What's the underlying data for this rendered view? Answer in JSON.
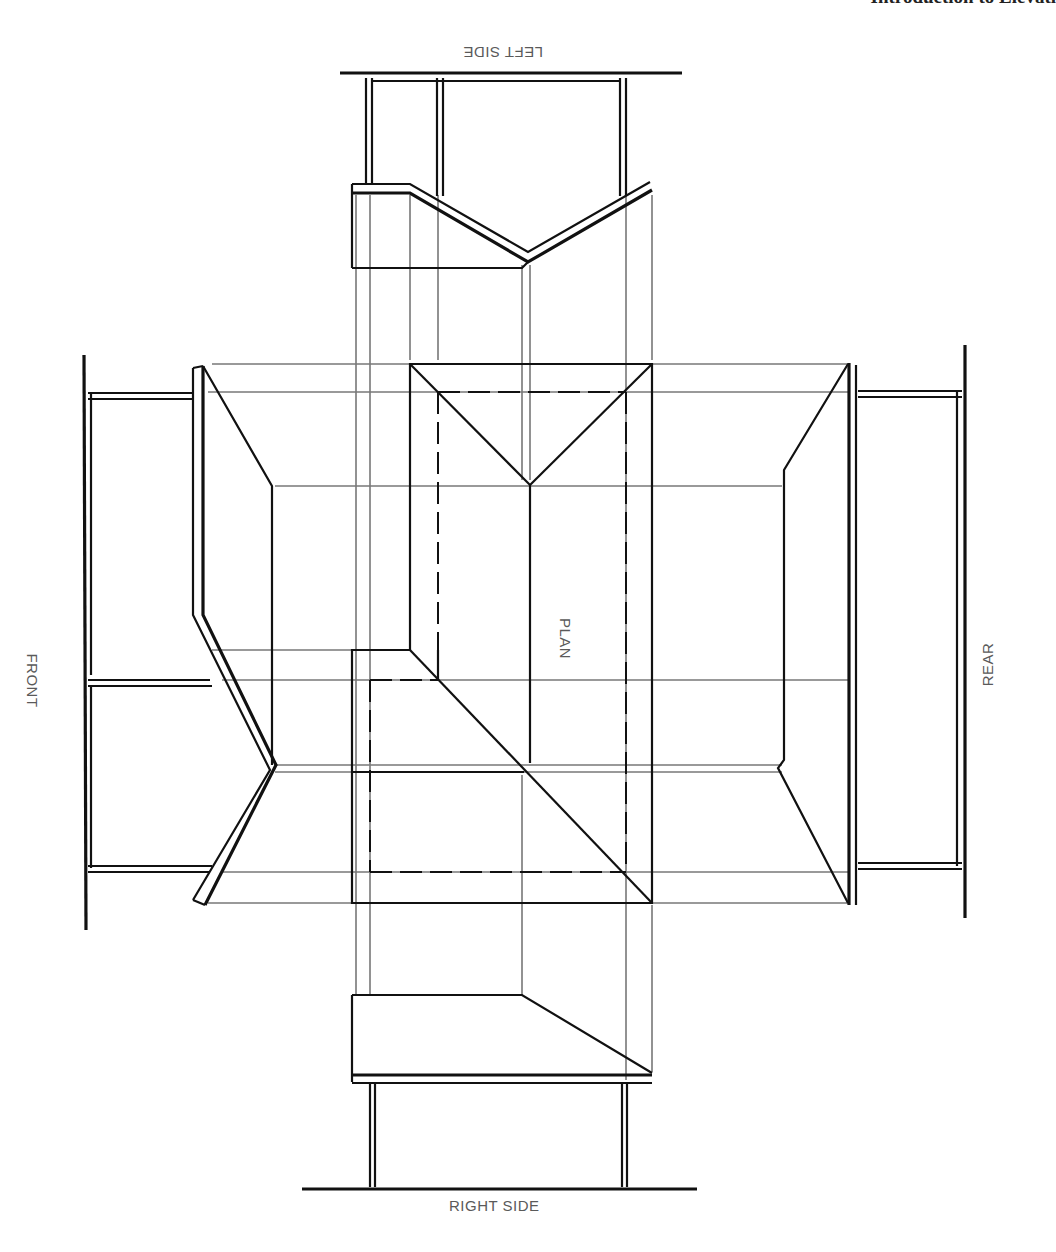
{
  "header": {
    "text": "Introduction to Elevati"
  },
  "labels": {
    "left_side": "LEFT SIDE",
    "right_side": "RIGHT SIDE",
    "front": "FRONT",
    "rear": "REAR",
    "plan": "PLAN"
  },
  "colors": {
    "object_line": "#111111",
    "projection_line": "#777777",
    "label_text": "#5a5a5a",
    "background": "#ffffff"
  }
}
